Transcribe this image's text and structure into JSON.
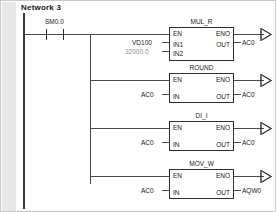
{
  "editor": {
    "network_label": "Network 3"
  },
  "rung": {
    "contact": {
      "label": "SM0.0",
      "type": "normally-open-contact"
    }
  },
  "blocks": [
    {
      "name": "MUL_R",
      "en": "EN",
      "eno": "ENO",
      "inputs": [
        {
          "pin": "IN1",
          "operand": "VD100",
          "dim": false
        },
        {
          "pin": "IN2",
          "operand": "32000.0",
          "dim": true
        }
      ],
      "out_pin": "OUT",
      "out_operand": "AC0"
    },
    {
      "name": "ROUND",
      "en": "EN",
      "eno": "ENO",
      "inputs": [
        {
          "pin": "IN",
          "operand": "AC0",
          "dim": false
        }
      ],
      "out_pin": "OUT",
      "out_operand": "AC0"
    },
    {
      "name": "DI_I",
      "en": "EN",
      "eno": "ENO",
      "inputs": [
        {
          "pin": "IN",
          "operand": "AC0",
          "dim": false
        }
      ],
      "out_pin": "OUT",
      "out_operand": "AC0"
    },
    {
      "name": "MOV_W",
      "en": "EN",
      "eno": "ENO",
      "inputs": [
        {
          "pin": "IN",
          "operand": "AC0",
          "dim": false
        }
      ],
      "out_pin": "OUT",
      "out_operand": "AQW0"
    }
  ],
  "colors": {
    "line": "#4a4a4a",
    "rail": "#3a3a3a",
    "text": "#1a1a1a",
    "dim_text": "#8e8e8e",
    "gutter": "#e8e8e8",
    "background": "#ffffff"
  }
}
